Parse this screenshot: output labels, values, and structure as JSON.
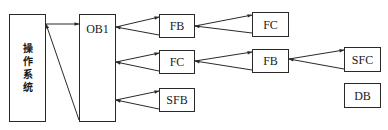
{
  "diagram": {
    "title": "",
    "nodes": {
      "os": {
        "label": "操作系统",
        "chars": [
          "操",
          "作",
          "系",
          "统"
        ]
      },
      "ob1": {
        "label": "OB1"
      },
      "fb1": {
        "label": "FB"
      },
      "fc1": {
        "label": "FC"
      },
      "sfb": {
        "label": "SFB"
      },
      "fc2": {
        "label": "FC"
      },
      "fb2": {
        "label": "FB"
      },
      "sfc": {
        "label": "SFC"
      },
      "db": {
        "label": "DB"
      }
    },
    "edges": [
      {
        "from": "os",
        "to": "ob1",
        "type": "call"
      },
      {
        "from": "ob1",
        "to": "os",
        "type": "return"
      },
      {
        "from": "ob1",
        "to": "fb1",
        "type": "call"
      },
      {
        "from": "fb1",
        "to": "ob1",
        "type": "return"
      },
      {
        "from": "fb1",
        "to": "fc2",
        "type": "call"
      },
      {
        "from": "fc2",
        "to": "fb1",
        "type": "return"
      },
      {
        "from": "ob1",
        "to": "fc1",
        "type": "call"
      },
      {
        "from": "fc1",
        "to": "ob1",
        "type": "return"
      },
      {
        "from": "fc1",
        "to": "fb2",
        "type": "call"
      },
      {
        "from": "fb2",
        "to": "fc1",
        "type": "return"
      },
      {
        "from": "fb2",
        "to": "sfc",
        "type": "call"
      },
      {
        "from": "sfc",
        "to": "fb2",
        "type": "return"
      },
      {
        "from": "ob1",
        "to": "sfb",
        "type": "call"
      },
      {
        "from": "sfb",
        "to": "ob1",
        "type": "return"
      }
    ],
    "colors": {
      "stroke": "#2a2a2a",
      "background": "#ffffff",
      "text": "#1a1a1a"
    }
  }
}
